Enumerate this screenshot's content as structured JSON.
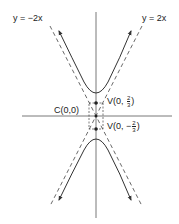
{
  "diagram": {
    "type": "hyperbola",
    "colors": {
      "stroke": "#333333",
      "text": "#222222",
      "background": "#ffffff"
    },
    "asymptotes": [
      {
        "label": "y = −2x",
        "equation": "y = -2x",
        "style": "dashed"
      },
      {
        "label": "y = 2x",
        "equation": "y = 2x",
        "style": "dashed"
      }
    ],
    "center": {
      "label": "C(0,0)",
      "prefix": "C",
      "coords": "(0,0)"
    },
    "vertices": [
      {
        "prefix": "V(0, ",
        "sign": "",
        "num": "2",
        "den": "3",
        "suffix": ")",
        "position": "upper"
      },
      {
        "prefix": "V(0, ",
        "sign": "−",
        "num": "2",
        "den": "3",
        "suffix": ")",
        "position": "lower"
      }
    ],
    "axes": {
      "horizontal": true,
      "vertical": true
    }
  }
}
